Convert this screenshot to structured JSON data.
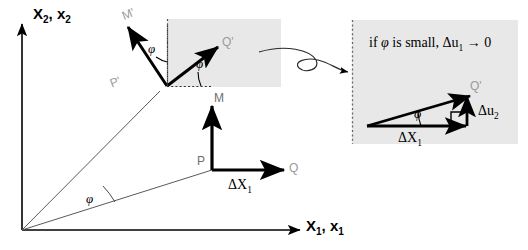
{
  "figure": {
    "background_color": "#ffffff",
    "inset_fill_color": "#e8e8e8",
    "gray_label_color": "#9a9a9a",
    "line_color": "#000000"
  },
  "axes": {
    "vertical": {
      "main": "X",
      "sub1": "2",
      "second": "x",
      "sub2": "2",
      "full": "X2, x2"
    },
    "horizontal": {
      "main": "X",
      "sub1": "1",
      "second": "x",
      "sub2": "1",
      "full": "X1, x1"
    }
  },
  "reference_config": {
    "point_p_label": "P",
    "vector_m_label": "M",
    "vector_q_label": "Q",
    "delta_x1_label": "ΔX",
    "delta_x1_sub": "1"
  },
  "deformed_config": {
    "point_p_prime_label": "P'",
    "vector_m_prime_label": "M'",
    "vector_q_prime_label": "Q'",
    "angle_label": "φ"
  },
  "rotation_angle": {
    "symbol": "φ",
    "occurrences": [
      "origin-sector",
      "m-prime-inset",
      "q-prime-inset",
      "detail-inset"
    ]
  },
  "detail_inset": {
    "note_prefix": "if ",
    "note_symbol": "φ",
    "note_middle": " is small, ",
    "note_delta": "Δu",
    "note_delta_sub": "1",
    "note_suffix": " → 0",
    "note_full": "if φ is small, Δu1 → 0",
    "base_label": "ΔX",
    "base_sub": "1",
    "rise_label": "Δu",
    "rise_sub": "2",
    "tip_label": "Q'",
    "angle_label": "φ"
  },
  "connector": {
    "name": "squiggly-pointer-arrow",
    "description": "curved S-shaped arrow from upper inset to detail inset"
  }
}
